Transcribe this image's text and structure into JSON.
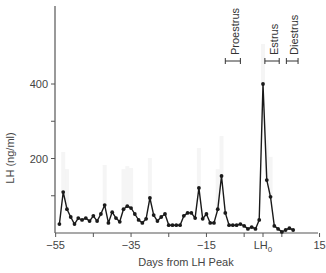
{
  "chart_data": {
    "type": "line",
    "title": "",
    "xlabel": "Days from LH Peak",
    "ylabel": "LH (ng/ml)",
    "xlim": [
      -55,
      15
    ],
    "ylim": [
      0,
      500
    ],
    "x_ticks": [
      {
        "value": -55,
        "label": "−55"
      },
      {
        "value": -45,
        "label": ""
      },
      {
        "value": -35,
        "label": "−35"
      },
      {
        "value": -25,
        "label": ""
      },
      {
        "value": -15,
        "label": "−15"
      },
      {
        "value": -5,
        "label": ""
      },
      {
        "value": 0,
        "label": "LH",
        "subscript": "0"
      },
      {
        "value": 5,
        "label": ""
      },
      {
        "value": 15,
        "label": "15"
      }
    ],
    "y_ticks": [
      {
        "value": 100,
        "label": ""
      },
      {
        "value": 200,
        "label": "200"
      },
      {
        "value": 300,
        "label": ""
      },
      {
        "value": 400,
        "label": "400"
      }
    ],
    "grid": false,
    "legend": null,
    "series": [
      {
        "name": "LH",
        "color": "#1a1a1a",
        "marker": "circle",
        "x": [
          -54,
          -53,
          -52,
          -51,
          -50,
          -49,
          -48,
          -47,
          -46,
          -45,
          -44,
          -43,
          -42,
          -41,
          -40,
          -39,
          -38,
          -37,
          -36,
          -35,
          -34,
          -33,
          -32,
          -31,
          -30,
          -29,
          -28,
          -27,
          -26,
          -25,
          -24,
          -23,
          -22,
          -21,
          -20,
          -19,
          -18,
          -17,
          -16,
          -15,
          -14,
          -13,
          -12,
          -11,
          -10,
          -9,
          -8,
          -7,
          -6,
          -5,
          -4,
          -3,
          -2,
          -1,
          0,
          1,
          2,
          3,
          4,
          5,
          6,
          7,
          8
        ],
        "values": [
          24,
          110,
          64,
          43,
          24,
          40,
          35,
          40,
          32,
          46,
          32,
          51,
          75,
          27,
          56,
          40,
          30,
          64,
          72,
          67,
          51,
          35,
          27,
          38,
          94,
          48,
          32,
          43,
          51,
          21,
          21,
          21,
          21,
          46,
          54,
          54,
          40,
          121,
          38,
          51,
          27,
          27,
          64,
          153,
          54,
          21,
          21,
          21,
          24,
          19,
          11,
          16,
          11,
          35,
          400,
          142,
          97,
          19,
          11,
          3,
          8,
          13,
          8
        ]
      }
    ],
    "annotations": [
      {
        "label": "Proestrus",
        "x_start": -10,
        "x_end": -6,
        "y_px": 61
      },
      {
        "label": "Estrus",
        "x_start": 0.5,
        "x_end": 4.3,
        "y_px": 61
      },
      {
        "label": "Diestrus",
        "x_start": 6.2,
        "x_end": 9.3,
        "y_px": 61
      }
    ]
  },
  "colors": {
    "line": "#1a1a1a",
    "axis": "#555555",
    "text": "#444444",
    "shadow": "#eeeeee"
  }
}
